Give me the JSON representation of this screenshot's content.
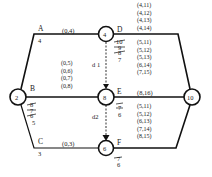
{
  "diagram": {
    "nodes": [
      {
        "id": "2",
        "label": "2",
        "x": 18,
        "y": 97
      },
      {
        "id": "4",
        "label": "4",
        "x": 106,
        "y": 34
      },
      {
        "id": "8",
        "label": "8",
        "x": 106,
        "y": 97
      },
      {
        "id": "6",
        "label": "6",
        "x": 106,
        "y": 148
      },
      {
        "id": "10",
        "label": "10",
        "x": 192,
        "y": 97
      }
    ],
    "edges": {
      "A": {
        "name": "A",
        "pair": "(0,4)",
        "duration": "4"
      },
      "B": {
        "name": "B",
        "pairs": [
          "(0,5)",
          "(0,6)",
          "(0,7)",
          "(0,8)"
        ],
        "struck": [
          "8",
          "7",
          "6"
        ],
        "duration": "5"
      },
      "C": {
        "name": "C",
        "pair": "(0,3)",
        "duration": "3"
      },
      "D": {
        "name": "D",
        "pairs_above": [
          "(4,11)",
          "(4,12)",
          "(4,13)",
          "(4,14)"
        ],
        "pairs_below": [
          "(5,11)",
          "(5,12)",
          "(5,13)",
          "(6,14)",
          "(7,15)",
          "(8,16)"
        ],
        "struck": [
          "10",
          "9",
          "8"
        ],
        "duration": "7"
      },
      "E": {
        "name": "E",
        "pair": "(8,16)",
        "pairs_below": [
          "(5,11)",
          "(5,12)",
          "(6,13)",
          "(7,14)",
          "(8,15)"
        ],
        "struck": [
          "7"
        ],
        "duration": "6"
      },
      "F": {
        "name": "F",
        "struck": [
          "7"
        ],
        "duration": "6"
      },
      "d1": {
        "name": "d 1"
      },
      "d2": {
        "name": "d2"
      }
    },
    "colors": {
      "line": "#111111",
      "background": "#ffffff"
    }
  }
}
